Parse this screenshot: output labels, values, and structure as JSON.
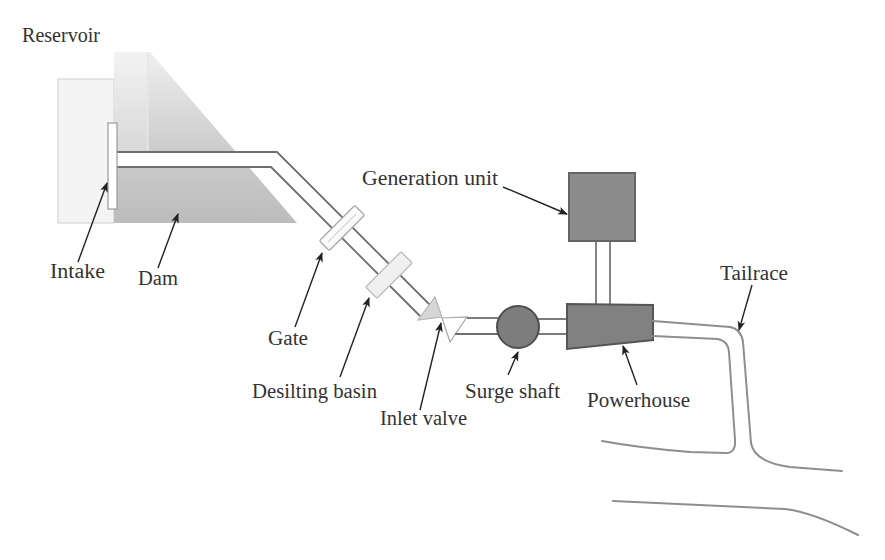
{
  "diagram": {
    "labels": {
      "reservoir": "Reservoir",
      "intake": "Intake",
      "dam": "Dam",
      "gate": "Gate",
      "desilting_basin": "Desilting basin",
      "inlet_valve": "Inlet valve",
      "surge_shaft": "Surge shaft",
      "generation_unit": "Generation unit",
      "powerhouse": "Powerhouse",
      "tailrace": "Tailrace"
    },
    "flow_order": [
      "Reservoir",
      "Intake",
      "Dam",
      "Gate",
      "Desilting basin",
      "Inlet valve",
      "Surge shaft",
      "Powerhouse",
      "Generation unit",
      "Tailrace"
    ],
    "colors": {
      "reservoir_water": "#f4f4f4",
      "reservoir_outline": "#d0d0d0",
      "dam_top": "#eeeeee",
      "dam_bottom": "#bcbcbc",
      "pipe_interior": "#ffffff",
      "pipe_stroke": "#6e6e6e",
      "gate_fill": "#fbfbfb",
      "desilting_fill": "#f0f0f0",
      "valve_upstream_fill": "#d6d6d6",
      "valve_downstream_fill": "#ffffff",
      "surge_shaft_fill": "#7d7d7d",
      "powerhouse_fill": "#818181",
      "generation_unit_fill": "#8c8c8c",
      "dark_outline": "#505050",
      "channel_stroke": "#8e8e8e",
      "text": "#333333",
      "arrow": "#222222"
    }
  }
}
